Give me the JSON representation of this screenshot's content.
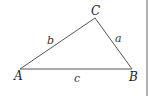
{
  "diagram": {
    "type": "triangle",
    "vertices": [
      {
        "name": "A",
        "x": 20,
        "y": 69
      },
      {
        "name": "B",
        "x": 132,
        "y": 69
      },
      {
        "name": "C",
        "x": 95,
        "y": 18
      }
    ],
    "vertex_labels": {
      "A": "A",
      "B": "B",
      "C": "C"
    },
    "side_labels": {
      "a": "a",
      "b": "b",
      "c": "c"
    },
    "stroke_color": "#555555",
    "border_color": "#999999"
  }
}
